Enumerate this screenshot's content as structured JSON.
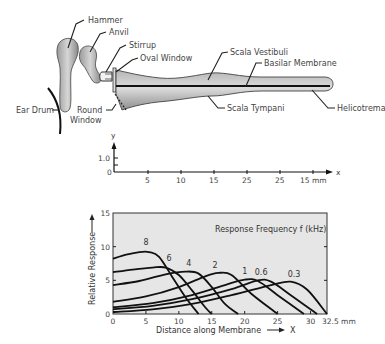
{
  "diagram": {
    "labels": {
      "hammer": "Hammer",
      "anvil": "Anvil",
      "stirrup": "Stirrup",
      "oval_window": "Oval Window",
      "scala_vestibuli": "Scala Vestibuli",
      "basilar_membrane": "Basilar Membrane",
      "ear_drum": "Ear Drum",
      "round_window_line1": "Round",
      "round_window_line2": "Window",
      "scala_tympani": "Scala Tympani",
      "helicotrema": "Helicotrema"
    }
  },
  "displacement_axis": {
    "y_label": "y",
    "x_label": "x",
    "y_ticks": [
      "1.0",
      "0"
    ],
    "x_ticks": [
      "5",
      "10",
      "15",
      "25",
      "25",
      "15 mm"
    ]
  },
  "chart_data": {
    "type": "line",
    "title": "Response Frequency f (kHz)",
    "xlabel": "Distance along Membrane",
    "xlabel_arrow": "X",
    "ylabel": "Relative Response",
    "xlim": [
      0,
      32.5
    ],
    "ylim": [
      0,
      15
    ],
    "x_ticks": [
      "0",
      "5",
      "10",
      "15",
      "20",
      "25",
      "30",
      "32.5 mm"
    ],
    "x_tick_values": [
      0,
      5,
      10,
      15,
      20,
      25,
      30,
      32.5
    ],
    "y_ticks": [
      "0",
      "5",
      "10",
      "15"
    ],
    "y_tick_values": [
      0,
      5,
      10,
      15
    ],
    "grid": false,
    "background": "#e6e6e6",
    "series": [
      {
        "name": "8",
        "x": [
          0,
          2,
          4,
          5.5,
          7,
          9,
          11,
          13
        ],
        "y": [
          8.2,
          8.8,
          9.2,
          9.2,
          8.5,
          5.5,
          2.5,
          0
        ]
      },
      {
        "name": "6",
        "x": [
          0,
          3,
          6,
          8,
          10,
          12,
          14,
          15
        ],
        "y": [
          6.2,
          6.6,
          6.9,
          6.9,
          5.8,
          3.5,
          1.0,
          0
        ]
      },
      {
        "name": "4",
        "x": [
          0,
          4,
          8,
          11,
          13,
          15,
          17,
          19
        ],
        "y": [
          4.3,
          4.9,
          5.9,
          6.3,
          6.0,
          4.0,
          1.5,
          0
        ]
      },
      {
        "name": "2",
        "x": [
          0,
          5,
          10,
          14,
          16,
          18,
          21,
          25
        ],
        "y": [
          1.8,
          2.6,
          4.0,
          5.6,
          6.1,
          5.8,
          3.0,
          0
        ]
      },
      {
        "name": "1",
        "x": [
          0,
          6,
          12,
          17,
          20,
          22,
          25,
          29
        ],
        "y": [
          1.0,
          1.6,
          2.8,
          4.3,
          5.1,
          4.9,
          2.8,
          0
        ]
      },
      {
        "name": "0.6",
        "x": [
          0,
          6,
          12,
          18,
          22,
          24,
          27,
          31
        ],
        "y": [
          0.7,
          1.2,
          2.2,
          3.7,
          5.0,
          4.8,
          2.8,
          0
        ]
      },
      {
        "name": "0.3",
        "x": [
          0,
          6,
          12,
          18,
          24,
          27,
          29.5,
          32.5
        ],
        "y": [
          0.3,
          0.7,
          1.5,
          2.8,
          4.3,
          4.8,
          3.6,
          0
        ]
      }
    ],
    "curve_labels": [
      {
        "text": "8",
        "x": 5.0,
        "y": 10.3
      },
      {
        "text": "6",
        "x": 8.5,
        "y": 7.8
      },
      {
        "text": "4",
        "x": 11.5,
        "y": 7.2
      },
      {
        "text": "2",
        "x": 15.5,
        "y": 6.8
      },
      {
        "text": "1",
        "x": 20.0,
        "y": 6.0
      },
      {
        "text": "0.6",
        "x": 22.5,
        "y": 5.8
      },
      {
        "text": "0.3",
        "x": 27.5,
        "y": 5.5
      }
    ]
  }
}
